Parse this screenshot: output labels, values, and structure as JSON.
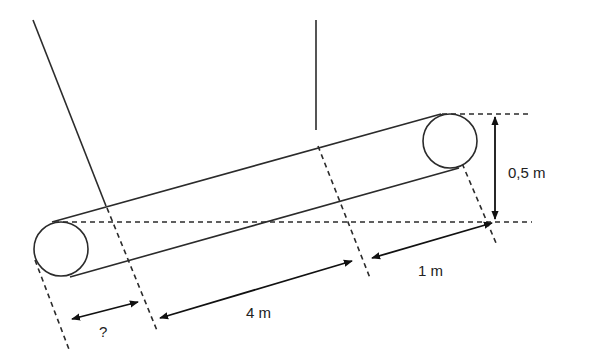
{
  "diagram": {
    "type": "inclined-cylinder-geometry",
    "labels": {
      "height": "0,5 m",
      "length_middle": "4 m",
      "length_right": "1 m",
      "unknown": "?"
    },
    "colors": {
      "line": "#2b2b2b",
      "background": "#ffffff"
    }
  }
}
